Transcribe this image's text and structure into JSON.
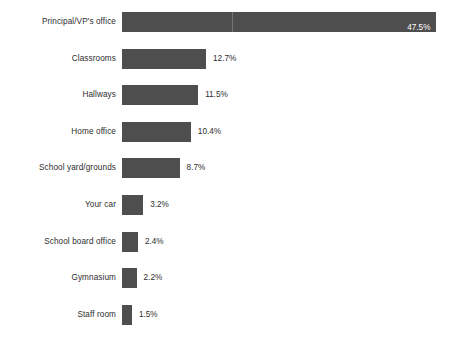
{
  "chart_data": {
    "type": "bar",
    "orientation": "horizontal",
    "title": "",
    "xlabel": "",
    "ylabel": "",
    "categories": [
      "Principal/VP's office",
      "Classrooms",
      "Hallways",
      "Home office",
      "School yard/grounds",
      "Your car",
      "School board office",
      "Gymnasium",
      "Staff room"
    ],
    "values": [
      47.5,
      12.7,
      11.5,
      10.4,
      8.7,
      3.2,
      2.4,
      2.2,
      1.5
    ],
    "data_labels": [
      "47.5%",
      "12.7%",
      "11.5%",
      "10.4%",
      "8.7%",
      "3.2%",
      "2.4%",
      "2.2%",
      "1.5%"
    ],
    "xlim": [
      0,
      50.9
    ],
    "grid": true,
    "legend": false,
    "bar_color": "#4e4e4e",
    "label_color": "#2e2e2e",
    "inside_label_color": "#ffffff",
    "background": "#ffffff"
  },
  "layout": {
    "bar_origin_x": 122,
    "px_per_percent": 6.62,
    "row_pitch": 36.6,
    "first_row_top": 6,
    "bar_height": 20,
    "gridline_x": 232
  }
}
